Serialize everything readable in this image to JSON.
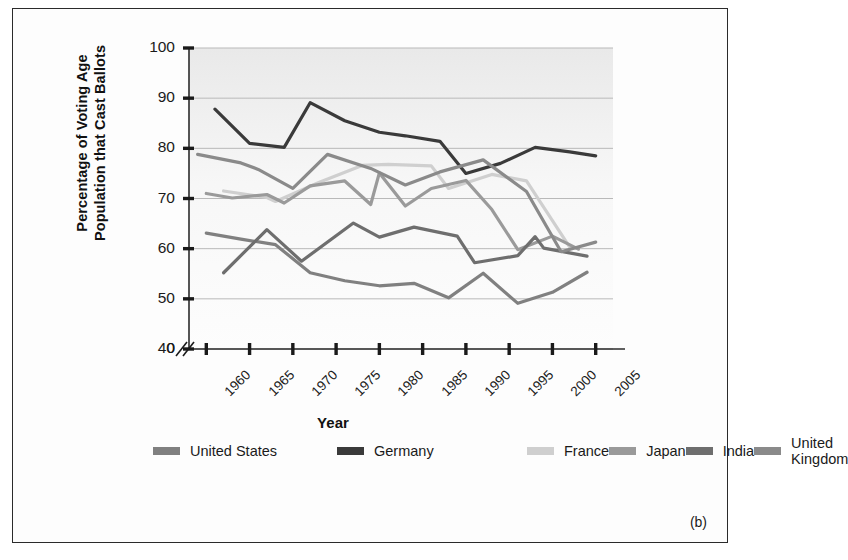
{
  "figure": {
    "panel_label": "(b)",
    "border_color": "#2b2b2b",
    "background": "#fdfdfd"
  },
  "chart_data": {
    "type": "line",
    "title": "",
    "xlabel": "Year",
    "ylabel": "Percentage of Voting Age\nPopulation that Cast Ballots",
    "xlim": [
      1958,
      2007
    ],
    "ylim": [
      38,
      100
    ],
    "ylim_display_break": true,
    "axis_break_note": "y-axis broken between 0 and 40",
    "grid": true,
    "grid_axis": "y",
    "legend_position": "below-plot",
    "yticks": [
      0,
      40,
      50,
      60,
      70,
      80,
      90,
      100
    ],
    "ytick_labels": [
      "0",
      "40",
      "50",
      "60",
      "70",
      "80",
      "90",
      "100"
    ],
    "xticks": [
      1960,
      1965,
      1970,
      1975,
      1980,
      1985,
      1990,
      1995,
      2000,
      2005
    ],
    "xtick_labels": [
      "1960",
      "1965",
      "1970",
      "1975",
      "1980",
      "1985",
      "1990",
      "1995",
      "2000",
      "2005"
    ],
    "series": [
      {
        "name": "United States",
        "color": "#808080",
        "x": [
          1960,
          1964,
          1968,
          1972,
          1976,
          1980,
          1984,
          1988,
          1992,
          1996,
          2000,
          2004
        ],
        "values": [
          63.1,
          61.9,
          60.8,
          55.2,
          53.6,
          52.6,
          53.1,
          50.2,
          55.1,
          49.1,
          51.3,
          55.3
        ]
      },
      {
        "name": "Germany",
        "color": "#3a3a3a",
        "x": [
          1961,
          1965,
          1969,
          1972,
          1976,
          1980,
          1983,
          1987,
          1990,
          1994,
          1998,
          2002,
          2005
        ],
        "values": [
          87.8,
          81.0,
          80.2,
          89.1,
          85.5,
          83.2,
          82.5,
          81.4,
          75.0,
          77.0,
          80.2,
          79.3,
          78.5
        ]
      },
      {
        "name": "France",
        "color": "#cfcfcf",
        "x": [
          1962,
          1967,
          1968,
          1973,
          1978,
          1981,
          1986,
          1988,
          1993,
          1997,
          2002
        ],
        "values": [
          71.5,
          70.2,
          69.4,
          73.2,
          76.6,
          76.8,
          76.5,
          72.0,
          74.8,
          73.5,
          60.3
        ]
      },
      {
        "name": "Japan",
        "color": "#9a9a9a",
        "x": [
          1960,
          1963,
          1967,
          1969,
          1972,
          1976,
          1979,
          1980,
          1983,
          1986,
          1990,
          1993,
          1996,
          2000,
          2003
        ],
        "values": [
          71.0,
          70.1,
          70.8,
          69.1,
          72.5,
          73.5,
          68.8,
          75.1,
          68.5,
          72.0,
          73.6,
          67.8,
          59.8,
          62.5,
          59.9
        ]
      },
      {
        "name": "India",
        "color": "#6e6e6e",
        "x": [
          1962,
          1967,
          1971,
          1977,
          1980,
          1984,
          1989,
          1991,
          1996,
          1998,
          1999,
          2004
        ],
        "values": [
          55.2,
          63.8,
          57.5,
          65.1,
          62.3,
          64.3,
          62.5,
          57.2,
          58.6,
          62.4,
          60.1,
          58.5
        ]
      },
      {
        "name": "United Kingdom",
        "color": "#8a8a8a",
        "x": [
          1959,
          1964,
          1966,
          1970,
          1974,
          1979,
          1983,
          1987,
          1992,
          1997,
          2001,
          2005
        ],
        "values": [
          78.8,
          77.1,
          75.8,
          72.0,
          78.8,
          76.0,
          72.7,
          75.3,
          77.7,
          71.4,
          59.4,
          61.3
        ]
      }
    ]
  },
  "legend": {
    "entries": [
      {
        "label": "United States",
        "color": "#808080"
      },
      {
        "label": "Germany",
        "color": "#3a3a3a"
      },
      {
        "label": "France",
        "color": "#cfcfcf"
      },
      {
        "label": "Japan",
        "color": "#9a9a9a"
      },
      {
        "label": "India",
        "color": "#6e6e6e"
      },
      {
        "label": "United Kingdom",
        "color": "#8a8a8a"
      }
    ]
  }
}
